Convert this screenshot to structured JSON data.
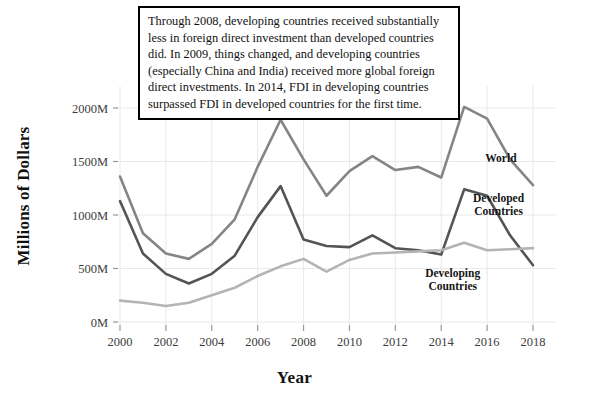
{
  "chart_data": {
    "type": "line",
    "title": "",
    "xlabel": "Year",
    "ylabel": "Millions of Dollars",
    "xlim": [
      1999.3,
      2018.6
    ],
    "ylim": [
      0,
      2150
    ],
    "grid": true,
    "legend_position": "inline-right",
    "x": [
      2000,
      2001,
      2002,
      2003,
      2004,
      2005,
      2006,
      2007,
      2008,
      2009,
      2010,
      2011,
      2012,
      2013,
      2014,
      2015,
      2016,
      2017,
      2018
    ],
    "xticks": [
      2000,
      2002,
      2004,
      2006,
      2008,
      2010,
      2012,
      2014,
      2016,
      2018
    ],
    "xtick_labels": [
      "2000",
      "2002",
      "2004",
      "2006",
      "2008",
      "2010",
      "2012",
      "2014",
      "2016",
      "2018"
    ],
    "yticks": [
      0,
      500,
      1000,
      1500,
      2000
    ],
    "ytick_labels": [
      "0M",
      "500M",
      "1000M",
      "1500M",
      "2000M"
    ],
    "series": [
      {
        "name": "World",
        "color": "#858585",
        "label_x": 2016.6,
        "label_y": 1500,
        "values": [
          1360,
          830,
          640,
          590,
          730,
          960,
          1450,
          1890,
          1520,
          1180,
          1410,
          1550,
          1420,
          1450,
          1350,
          2010,
          1900,
          1520,
          1280
        ]
      },
      {
        "name": "Developed Countries",
        "color": "#545454",
        "label_x": 2016.5,
        "label_y": 1120,
        "values": [
          1130,
          640,
          450,
          360,
          450,
          620,
          980,
          1270,
          770,
          710,
          700,
          810,
          690,
          670,
          630,
          1240,
          1180,
          810,
          530
        ]
      },
      {
        "name": "Developing Countries",
        "color": "#b4b4b4",
        "label_x": 2014.5,
        "label_y": 420,
        "values": [
          200,
          180,
          150,
          180,
          250,
          320,
          430,
          520,
          590,
          470,
          580,
          640,
          650,
          660,
          670,
          740,
          670,
          680,
          690
        ]
      }
    ]
  },
  "annotation": {
    "text": "Through 2008, developing countries received substantially less in foreign direct investment than developed countries did. In 2009, things changed, and developing countries (especially China and India) received more global foreign direct investments. In 2014, FDI in developing countries surpassed FDI in developed countries for the first time."
  }
}
